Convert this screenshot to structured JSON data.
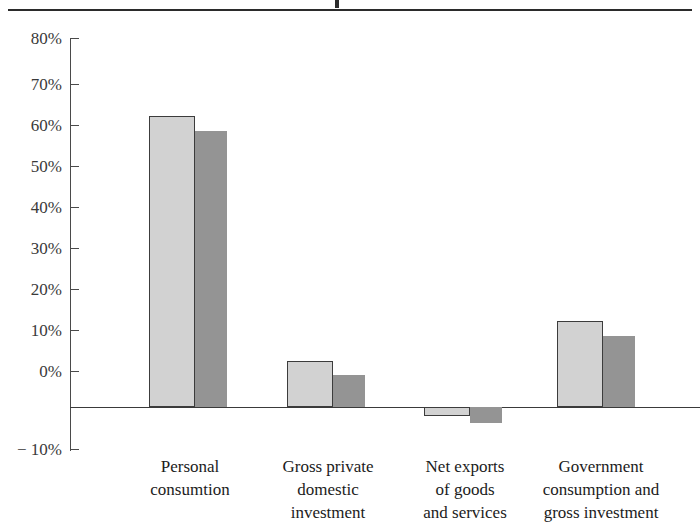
{
  "figure": {
    "top_rule": true,
    "title_cut_off": true
  },
  "chart_data": {
    "type": "bar",
    "title": "",
    "xlabel": "",
    "ylabel": "",
    "ylim": [
      -10,
      80
    ],
    "grid": false,
    "legend_position": "none",
    "categories": [
      "Personal\nconsumtion",
      "Gross private\ndomestic\ninvestment",
      "Net exports\nof goods\nand services",
      "Government\nconsumption and\ngross investment"
    ],
    "ytick_labels": [
      "80%",
      "70%",
      "60%",
      "50%",
      "40%",
      "30%",
      "20%",
      "10%",
      "0%",
      "− 10%"
    ],
    "ytick_values": [
      80,
      70,
      60,
      50,
      40,
      30,
      20,
      10,
      0,
      -10
    ],
    "series": [
      {
        "name": "series-light",
        "color": "#d2d2d2",
        "values": [
          71.0,
          11.3,
          -2.1,
          21.0
        ]
      },
      {
        "name": "series-dark",
        "color": "#949494",
        "values": [
          67.2,
          7.9,
          -3.8,
          17.3
        ]
      }
    ]
  }
}
